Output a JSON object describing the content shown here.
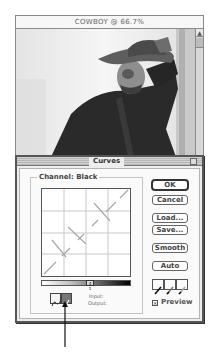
{
  "document_window": {
    "title": "COWBOY @ 66.7%",
    "zoom_level": "66.7%",
    "scroll_up_glyph": "▲"
  },
  "curves_dialog": {
    "title": "Curves",
    "channel_label": "Channel: Black",
    "gradient_marker": "4 1",
    "input_label": "Input:",
    "output_label": "Output:",
    "buttons": {
      "ok": "OK",
      "cancel": "Cancel",
      "load": "Load...",
      "save": "Save...",
      "smooth": "Smooth",
      "auto": "Auto"
    },
    "tools": {
      "curve_tool": "curve-icon",
      "pencil_tool": "pencil-icon",
      "selected": "pencil_tool"
    },
    "eyedroppers": [
      "black-eyedropper-icon",
      "gray-eyedropper-icon",
      "white-eyedropper-icon"
    ],
    "preview": {
      "label": "Preview",
      "checked": true,
      "check_glyph": "×"
    }
  },
  "colors": {
    "dialog_bg": "#ededed",
    "inner_bg": "#fafafa",
    "border": "#555555",
    "selected_tool": "#777777"
  }
}
